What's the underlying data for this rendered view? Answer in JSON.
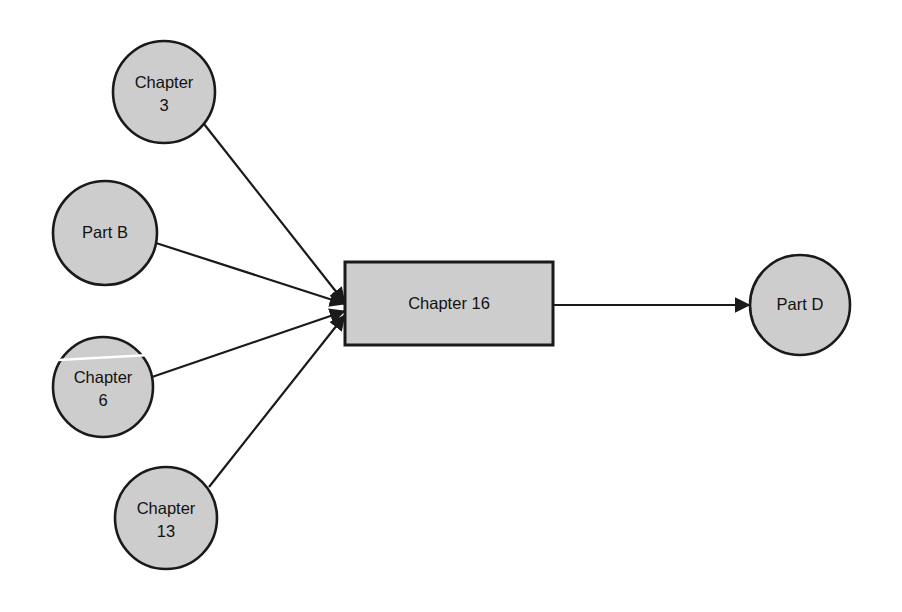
{
  "diagram": {
    "background_color": "#ffffff",
    "node_fill_color": "#cdcdcd",
    "node_stroke_color": "#1a1a1a",
    "edge_color": "#1a1a1a",
    "nodes": [
      {
        "id": "chapter-3",
        "shape": "circle",
        "label_line_1": "Chapter",
        "label_line_2": "3",
        "cx": 164,
        "cy": 92,
        "r": 51
      },
      {
        "id": "part-b",
        "shape": "circle",
        "label_line_1": "Part B",
        "label_line_2": "",
        "cx": 105,
        "cy": 233,
        "r": 52
      },
      {
        "id": "chapter-6",
        "shape": "circle",
        "label_line_1": "Chapter",
        "label_line_2": "6",
        "cx": 103,
        "cy": 387,
        "r": 50
      },
      {
        "id": "chapter-13",
        "shape": "circle",
        "label_line_1": "Chapter",
        "label_line_2": "13",
        "cx": 166,
        "cy": 518,
        "r": 51
      },
      {
        "id": "chapter-16",
        "shape": "rectangle",
        "label_line_1": "Chapter 16",
        "label_line_2": "",
        "x": 345,
        "y": 262,
        "width": 208,
        "height": 83
      },
      {
        "id": "part-d",
        "shape": "circle",
        "label_line_1": "Part D",
        "label_line_2": "",
        "cx": 800,
        "cy": 305,
        "r": 50
      }
    ],
    "edges": [
      {
        "id": "edge-chapter-3-to-chapter-16",
        "from": "chapter-3",
        "to": "chapter-16",
        "x1": 204,
        "y1": 124,
        "x2": 345,
        "y2": 303,
        "arrowhead": "target"
      },
      {
        "id": "edge-part-b-to-chapter-16",
        "from": "part-b",
        "to": "chapter-16",
        "x1": 156,
        "y1": 243,
        "x2": 345,
        "y2": 304,
        "arrowhead": "target"
      },
      {
        "id": "edge-chapter-6-to-chapter-16",
        "from": "chapter-6",
        "to": "chapter-16",
        "x1": 152,
        "y1": 377,
        "x2": 345,
        "y2": 311,
        "arrowhead": "target"
      },
      {
        "id": "edge-chapter-13-to-chapter-16",
        "from": "chapter-13",
        "to": "chapter-16",
        "x1": 209,
        "y1": 487,
        "x2": 345,
        "y2": 315,
        "arrowhead": "target"
      },
      {
        "id": "edge-chapter-16-to-part-d",
        "from": "chapter-16",
        "to": "part-d",
        "x1": 553,
        "y1": 305,
        "x2": 750,
        "y2": 305,
        "arrowhead": "target"
      }
    ],
    "artifacts": [
      {
        "id": "scan-line-chapter-6",
        "description": "white horizontal scan streak across chapter-6 node",
        "x1": 58,
        "y1": 360,
        "x2": 150,
        "y2": 355
      }
    ]
  }
}
